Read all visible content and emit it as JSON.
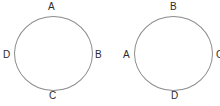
{
  "figure": {
    "title": "",
    "background_color": "#ffffff",
    "stroke_color": "#8c8c8c",
    "text_color": "#2b2b2b"
  },
  "diagrams": [
    {
      "id": "circle-left",
      "shape": "circle",
      "labels": {
        "top": "A",
        "right": "B",
        "bottom": "C",
        "left": "D"
      }
    },
    {
      "id": "circle-right",
      "shape": "circle",
      "labels": {
        "top": "B",
        "right": "C",
        "bottom": "D",
        "left": "A"
      }
    }
  ]
}
